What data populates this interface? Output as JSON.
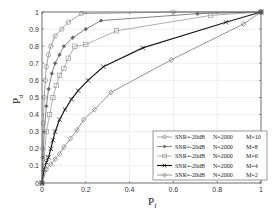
{
  "chart_data": {
    "type": "line",
    "title": "",
    "xlabel": "P_f",
    "ylabel": "P_d",
    "xlabel_main": "P",
    "xlabel_sub": "f",
    "ylabel_main": "P",
    "ylabel_sub": "d",
    "xlim": [
      0,
      1
    ],
    "ylim": [
      0,
      1
    ],
    "grid": true,
    "legend_position": "lower right",
    "x_ticks": [
      "0",
      "0.2",
      "0.4",
      "0.6",
      "0.8",
      "1"
    ],
    "y_ticks": [
      "0",
      "0.1",
      "0.2",
      "0.3",
      "0.4",
      "0.5",
      "0.6",
      "0.7",
      "0.8",
      "0.9",
      "1"
    ],
    "series": [
      {
        "name": "SNR=-20dB  N=2000  M=10",
        "legend": {
          "snr": "SNR=-20dB",
          "n": "N=2000",
          "m": "M=10"
        },
        "marker": "circle",
        "color": "#8c8c8c",
        "line_width": 0.8,
        "x": [
          0,
          0.003,
          0.006,
          0.01,
          0.015,
          0.02,
          0.03,
          0.04,
          0.06,
          0.09,
          0.12,
          0.18,
          0.6,
          1.0
        ],
        "y": [
          0,
          0.2,
          0.35,
          0.5,
          0.6,
          0.68,
          0.75,
          0.8,
          0.86,
          0.9,
          0.94,
          0.99,
          1.0,
          1.0
        ]
      },
      {
        "name": "SNR=-20dB  N=2000  M=8",
        "legend": {
          "snr": "SNR=-20dB",
          "n": "N=2000",
          "m": "M=8"
        },
        "marker": "star",
        "color": "#666666",
        "line_width": 0.8,
        "x": [
          0,
          0.005,
          0.01,
          0.02,
          0.03,
          0.045,
          0.06,
          0.08,
          0.1,
          0.14,
          0.2,
          0.27,
          0.71,
          1.0
        ],
        "y": [
          0,
          0.15,
          0.3,
          0.45,
          0.55,
          0.64,
          0.7,
          0.75,
          0.8,
          0.85,
          0.9,
          0.95,
          0.99,
          1.0
        ]
      },
      {
        "name": "SNR=-20dB  N=2000  M=6",
        "legend": {
          "snr": "SNR=-20dB",
          "n": "N=2000",
          "m": "M=6"
        },
        "marker": "square",
        "color": "#9a9a9a",
        "line_width": 0.8,
        "x": [
          0,
          0.01,
          0.02,
          0.035,
          0.05,
          0.065,
          0.08,
          0.1,
          0.12,
          0.15,
          0.2,
          0.34,
          0.77,
          1.0
        ],
        "y": [
          0,
          0.15,
          0.3,
          0.4,
          0.5,
          0.57,
          0.63,
          0.67,
          0.73,
          0.8,
          0.81,
          0.89,
          0.98,
          1.0
        ]
      },
      {
        "name": "SNR=-20dB  N=2000  M=4",
        "legend": {
          "snr": "SNR=-20dB",
          "n": "N=2000",
          "m": "M=4"
        },
        "marker": "x",
        "color": "#1a1a1a",
        "line_width": 1.2,
        "x": [
          0,
          0.01,
          0.02,
          0.03,
          0.04,
          0.05,
          0.06,
          0.08,
          0.105,
          0.135,
          0.165,
          0.21,
          0.28,
          0.46,
          0.84,
          1.0
        ],
        "y": [
          0,
          0.08,
          0.12,
          0.15,
          0.2,
          0.25,
          0.3,
          0.37,
          0.43,
          0.49,
          0.54,
          0.6,
          0.68,
          0.79,
          0.94,
          1.0
        ]
      },
      {
        "name": "SNR=-20dB  N=2000  M=2",
        "legend": {
          "snr": "SNR=-20dB",
          "n": "N=2000",
          "m": "M=2"
        },
        "marker": "diamond",
        "color": "#7a7a7a",
        "line_width": 0.8,
        "x": [
          0,
          0.02,
          0.04,
          0.06,
          0.08,
          0.1,
          0.13,
          0.16,
          0.19,
          0.24,
          0.315,
          0.59,
          0.92,
          1.0
        ],
        "y": [
          0,
          0.08,
          0.11,
          0.14,
          0.17,
          0.21,
          0.26,
          0.31,
          0.37,
          0.43,
          0.53,
          0.72,
          0.93,
          1.0
        ]
      }
    ]
  }
}
